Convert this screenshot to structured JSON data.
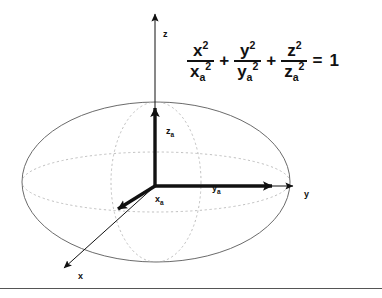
{
  "figure": {
    "background_color": "#ffffff",
    "ink_color": "#111111",
    "outline_color": "#6b6b6b",
    "dashed_color": "#b0b0b0",
    "rule_color": "#555555"
  },
  "axes": [
    {
      "id": "z",
      "label": "z",
      "direction": "up",
      "label_x": 163,
      "label_y": 37
    },
    {
      "id": "y",
      "label": "y",
      "direction": "right",
      "label_x": 304,
      "label_y": 197
    },
    {
      "id": "x",
      "label": "x",
      "direction": "down-left",
      "label_x": 78,
      "label_y": 279
    }
  ],
  "semi_axes": [
    {
      "id": "xa",
      "base": "x",
      "sub": "a",
      "label_x": 155,
      "label_y": 202
    },
    {
      "id": "ya",
      "base": "y",
      "sub": "a",
      "label_x": 212,
      "label_y": 191
    },
    {
      "id": "za",
      "base": "z",
      "sub": "a",
      "label_x": 166,
      "label_y": 134
    }
  ],
  "equation": {
    "terms": [
      {
        "num_base": "x",
        "num_exp": "2",
        "den_base": "x",
        "den_sub": "a",
        "den_exp": "2"
      },
      {
        "num_base": "y",
        "num_exp": "2",
        "den_base": "y",
        "den_sub": "a",
        "den_exp": "2"
      },
      {
        "num_base": "z",
        "num_exp": "2",
        "den_base": "z",
        "den_sub": "a",
        "den_exp": "2"
      }
    ],
    "plus_1": "+",
    "plus_2": "+",
    "equals": "=",
    "right_hand_side": "1",
    "plain_text": "x^2/xa^2 + y^2/ya^2 + z^2/za^2 = 1"
  },
  "geometry": {
    "origin": {
      "x": 155,
      "y": 186
    },
    "ellipse_outline": {
      "cx": 156,
      "cy": 182,
      "rx": 134,
      "ry": 80
    },
    "dashed_equator": {
      "cx": 156,
      "cy": 182,
      "rx": 134,
      "ry": 30
    },
    "dashed_meridian": {
      "cx": 156,
      "cy": 182,
      "rx": 45,
      "ry": 80
    },
    "z_axis_tip": {
      "x": 155,
      "y": 10
    },
    "za_arrow_tip": {
      "x": 155,
      "y": 103
    },
    "y_axis_tip": {
      "x": 297,
      "y": 186
    },
    "ya_arrow_tip": {
      "x": 278,
      "y": 186
    },
    "x_axis_tip": {
      "x": 60,
      "y": 272
    },
    "xa_arrow_tip": {
      "x": 113,
      "y": 214
    }
  }
}
